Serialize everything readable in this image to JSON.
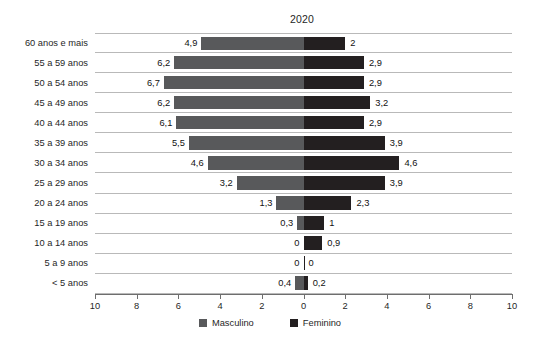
{
  "chart_data": {
    "type": "bar",
    "title": "2020",
    "xlabel": "",
    "ylabel": "",
    "orientation": "horizontal",
    "layout": "population-pyramid-diverging",
    "grid": "horizontal-row-separators",
    "legend_position": "bottom-center",
    "xlim": [
      -10,
      10
    ],
    "axis_tick_labels_left": [
      "10",
      "8",
      "6",
      "4",
      "2"
    ],
    "axis_tick_labels_center": "0",
    "axis_tick_labels_right": [
      "2",
      "4",
      "6",
      "8",
      "10"
    ],
    "axis_ticks_display": [
      "10",
      "8",
      "6",
      "4",
      "2",
      "0",
      "2",
      "4",
      "6",
      "8",
      "10"
    ],
    "axis_tick_values": [
      -10,
      -8,
      -6,
      -4,
      -2,
      0,
      2,
      4,
      6,
      8,
      10
    ],
    "categories": [
      "60 anos e mais",
      "55 a 59 anos",
      "50 a 54 anos",
      "45 a 49 anos",
      "40 a 44 anos",
      "35 a 39 anos",
      "30 a 34 anos",
      "25 a 29 anos",
      "20 a 24 anos",
      "15 a 19 anos",
      "10 a 14 anos",
      "5 a 9 anos",
      "< 5 anos"
    ],
    "series": [
      {
        "name": "Masculino",
        "color": "#58595b",
        "side": "left",
        "values": [
          4.9,
          6.2,
          6.7,
          6.2,
          6.1,
          5.5,
          4.6,
          3.2,
          1.3,
          0.3,
          0.0,
          0.0,
          0.4
        ],
        "labels": [
          "4,9",
          "6,2",
          "6,7",
          "6,2",
          "6,1",
          "5,5",
          "4,6",
          "3,2",
          "1,3",
          "0,3",
          "0",
          "0",
          "0,4"
        ]
      },
      {
        "name": "Feminino",
        "color": "#231f20",
        "side": "right",
        "values": [
          2.0,
          2.9,
          2.9,
          3.2,
          2.9,
          3.9,
          4.6,
          3.9,
          2.3,
          1.0,
          0.9,
          0.0,
          0.2
        ],
        "labels": [
          "2",
          "2,9",
          "2,9",
          "3,2",
          "2,9",
          "3,9",
          "4,6",
          "3,9",
          "2,3",
          "1",
          "0,9",
          "0",
          "0,2"
        ]
      }
    ]
  },
  "legend": {
    "items": [
      {
        "label": "Masculino",
        "color": "#58595b"
      },
      {
        "label": "Feminino",
        "color": "#231f20"
      }
    ]
  },
  "colors": {
    "masculino": "#58595b",
    "feminino": "#231f20",
    "axis": "#6e6e6e",
    "gridline": "#b9b9b9",
    "background": "#ffffff"
  }
}
